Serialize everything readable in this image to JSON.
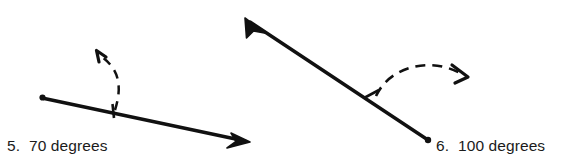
{
  "page": {
    "background_color": "#ffffff",
    "ink_color": "#111111",
    "width": 588,
    "height": 166
  },
  "problems": [
    {
      "id": "problem-5",
      "number": "5.",
      "answer": "70 degrees",
      "caption": "5.  70 degrees",
      "ray": {
        "origin": [
          42,
          98
        ],
        "tip": [
          250,
          142
        ],
        "has_origin_dot": true,
        "has_arrowhead": true
      },
      "vertex": [
        113,
        113
      ],
      "vertex_tick": {
        "from": [
          112,
          106
        ],
        "to": [
          114,
          120
        ]
      },
      "angle_arc": {
        "style": "dashed",
        "start": [
          116,
          108
        ],
        "control": [
          122,
          70
        ],
        "end": [
          101,
          57
        ],
        "arrow_direction": "up-left",
        "arrow_tip": [
          96,
          50
        ]
      }
    },
    {
      "id": "problem-6",
      "number": "6.",
      "answer": "100 degrees",
      "caption": "6.  100 degrees",
      "ray": {
        "origin": [
          428,
          140
        ],
        "tip": [
          245,
          18
        ],
        "has_origin_dot": true,
        "has_arrowhead": true
      },
      "vertex": [
        372,
        102
      ],
      "vertex_tick": {
        "from": [
          366,
          97
        ],
        "to": [
          381,
          90
        ]
      },
      "angle_arc": {
        "style": "dashed",
        "start": [
          377,
          95
        ],
        "control": [
          412,
          52
        ],
        "end": [
          463,
          74
        ],
        "arrow_direction": "right",
        "arrow_tip": [
          468,
          77
        ]
      }
    }
  ]
}
